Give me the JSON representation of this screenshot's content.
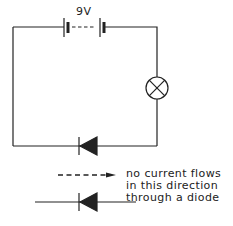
{
  "diagram": {
    "battery": {
      "label": "9V",
      "icon": "battery-icon"
    },
    "lamp": {
      "icon": "lamp-icon"
    },
    "diode": {
      "icon": "diode-icon"
    },
    "legend": {
      "arrow_icon": "dashed-arrow-icon",
      "lines": [
        "no current flows",
        "in this direction",
        "through a diode"
      ]
    },
    "colors": {
      "stroke": "#222222",
      "background": "#ffffff"
    }
  }
}
